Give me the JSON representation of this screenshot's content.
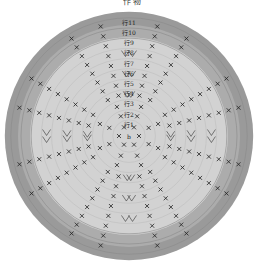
{
  "title": "作  物",
  "diagram": {
    "type": "crochet-round-chart",
    "center": "b",
    "rounds": [
      "行1",
      "行2",
      "行3",
      "行4",
      "行5",
      "行6",
      "行7",
      "行8",
      "行9",
      "行10",
      "行11"
    ],
    "colors": {
      "background": "#ffffff",
      "inner_fill": "#d2d2d2",
      "outer_band": "#9a9a9a",
      "outer_band_inner": "#acacac",
      "ring_line": "#bdbdbd",
      "stitch": "#222222"
    },
    "symbols": {
      "single_crochet": "×",
      "increase": "V"
    }
  }
}
